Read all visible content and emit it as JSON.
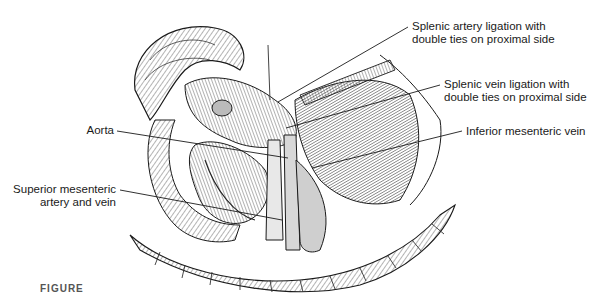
{
  "figure": {
    "type": "anatomical-illustration",
    "caption_partial": "FIGURE"
  },
  "labels": [
    {
      "id": "splenic-artery",
      "line1": "Splenic artery ligation with",
      "line2": "double ties on proximal side"
    },
    {
      "id": "splenic-vein",
      "line1": "Splenic vein ligation with",
      "line2": "double ties on proximal side"
    },
    {
      "id": "inferior-mesenteric-vein",
      "line1": "Inferior mesenteric vein",
      "line2": ""
    },
    {
      "id": "aorta",
      "line1": "Aorta",
      "line2": ""
    },
    {
      "id": "sma-smv",
      "line1": "Superior mesenteric",
      "line2": "artery and vein"
    }
  ],
  "colors": {
    "ink": "#1a1a1a",
    "shade": "#9a9a9a",
    "background": "#ffffff"
  }
}
